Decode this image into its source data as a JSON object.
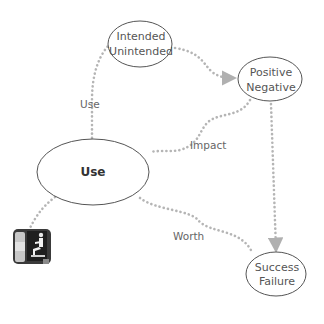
{
  "diagram": {
    "nodes": [
      {
        "id": "use",
        "lines": [
          "Use"
        ],
        "bold": true
      },
      {
        "id": "intended",
        "lines": [
          "Intended",
          "Unintended"
        ]
      },
      {
        "id": "positive",
        "lines": [
          "Positive",
          "Negative"
        ]
      },
      {
        "id": "success",
        "lines": [
          "Success",
          "Failure"
        ]
      }
    ],
    "edges": [
      {
        "from": "use",
        "to": "intended",
        "label": "Use"
      },
      {
        "from": "intended",
        "to": "positive",
        "label": ""
      },
      {
        "from": "positive",
        "to": "use",
        "label": "Impact"
      },
      {
        "from": "positive",
        "to": "success",
        "label": ""
      },
      {
        "from": "use",
        "to": "success",
        "label": "Worth"
      },
      {
        "from": "use",
        "to": "user-icon",
        "label": ""
      }
    ],
    "icon": "person-at-computer-icon",
    "colors": {
      "edge": "#b5b5b5",
      "node_stroke": "#555555",
      "text": "#555555"
    }
  }
}
